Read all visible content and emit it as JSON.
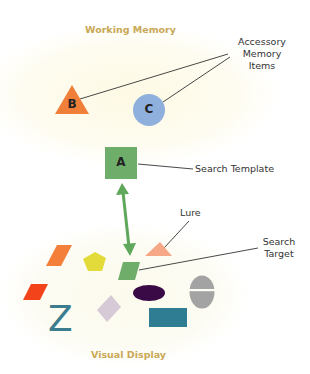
{
  "diagram": {
    "regions": {
      "working_memory": {
        "label": "Working Memory",
        "color": "#c9a856",
        "bg": "#fdfbee"
      },
      "visual_display": {
        "label": "Visual Display",
        "color": "#c9a856",
        "bg": "#fcfbf0"
      }
    },
    "memory_items": [
      {
        "id": "B",
        "shape": "triangle",
        "letter": "B",
        "color": "#f07f3a"
      },
      {
        "id": "C",
        "shape": "circle",
        "letter": "C",
        "color": "#8fb0dd"
      }
    ],
    "template": {
      "id": "A",
      "shape": "square",
      "letter": "A",
      "color": "#6fae6a"
    },
    "annotations": {
      "accessory": [
        "Accessory",
        "Memory",
        "Items"
      ],
      "search_template": "Search Template",
      "lure": "Lure",
      "search_target": [
        "Search",
        "Target"
      ]
    },
    "arrow": {
      "type": "double-headed",
      "color": "#5fa85b"
    },
    "display_items": [
      {
        "name": "orange-parallelogram",
        "color": "#f37f3a"
      },
      {
        "name": "yellow-pentagon",
        "color": "#e3db3a"
      },
      {
        "name": "green-parallelogram-target",
        "color": "#6fae6a"
      },
      {
        "name": "salmon-triangle-lure",
        "color": "#f5a786"
      },
      {
        "name": "red-parallelogram",
        "color": "#f3431a"
      },
      {
        "name": "teal-z-letter",
        "color": "#3b7d8e",
        "letter": "Z"
      },
      {
        "name": "lilac-diamond",
        "color": "#d5cad6"
      },
      {
        "name": "dark-purple-ellipse",
        "color": "#3a0a46"
      },
      {
        "name": "gray-split-ellipse",
        "color": "#a3a3a3"
      },
      {
        "name": "teal-rectangle",
        "color": "#2f7d93"
      }
    ]
  }
}
